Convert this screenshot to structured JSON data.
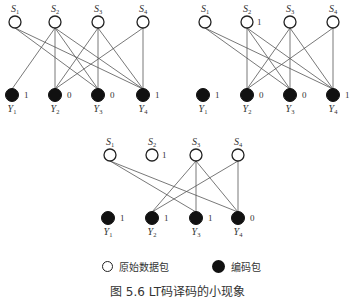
{
  "figure": {
    "caption": "图 5.6  LT码译码的小现象",
    "legend": {
      "source_label": "原始数据包",
      "encoded_label": "编码包"
    }
  },
  "graphs": [
    {
      "name": "stage-1",
      "source_nodes": [
        {
          "label": "S",
          "sub": "1",
          "x": 15,
          "y": 22,
          "value": ""
        },
        {
          "label": "S",
          "sub": "2",
          "x": 55,
          "y": 22,
          "value": ""
        },
        {
          "label": "S",
          "sub": "3",
          "x": 98,
          "y": 22,
          "value": ""
        },
        {
          "label": "S",
          "sub": "4",
          "x": 143,
          "y": 22,
          "value": ""
        }
      ],
      "encoded_nodes": [
        {
          "label": "Y",
          "sub": "1",
          "x": 12,
          "y": 95,
          "value": "1"
        },
        {
          "label": "Y",
          "sub": "2",
          "x": 55,
          "y": 95,
          "value": "0"
        },
        {
          "label": "Y",
          "sub": "3",
          "x": 98,
          "y": 95,
          "value": "0"
        },
        {
          "label": "Y",
          "sub": "4",
          "x": 143,
          "y": 95,
          "value": "1"
        }
      ],
      "edges": [
        [
          0,
          2
        ],
        [
          0,
          3
        ],
        [
          1,
          0
        ],
        [
          1,
          1
        ],
        [
          1,
          2
        ],
        [
          1,
          3
        ],
        [
          2,
          1
        ],
        [
          2,
          2
        ],
        [
          2,
          3
        ],
        [
          3,
          1
        ],
        [
          3,
          3
        ]
      ]
    },
    {
      "name": "stage-2",
      "source_nodes": [
        {
          "label": "S",
          "sub": "1",
          "x": 205,
          "y": 22,
          "value": ""
        },
        {
          "label": "S",
          "sub": "2",
          "x": 247,
          "y": 22,
          "value": "1"
        },
        {
          "label": "S",
          "sub": "3",
          "x": 290,
          "y": 22,
          "value": ""
        },
        {
          "label": "S",
          "sub": "4",
          "x": 333,
          "y": 22,
          "value": ""
        }
      ],
      "encoded_nodes": [
        {
          "label": "Y",
          "sub": "1",
          "x": 203,
          "y": 95,
          "value": "1"
        },
        {
          "label": "Y",
          "sub": "2",
          "x": 247,
          "y": 95,
          "value": "0"
        },
        {
          "label": "Y",
          "sub": "3",
          "x": 290,
          "y": 95,
          "value": "0"
        },
        {
          "label": "Y",
          "sub": "4",
          "x": 333,
          "y": 95,
          "value": "1"
        }
      ],
      "edges": [
        [
          0,
          2
        ],
        [
          0,
          3
        ],
        [
          1,
          1
        ],
        [
          1,
          2
        ],
        [
          1,
          3
        ],
        [
          2,
          1
        ],
        [
          2,
          2
        ],
        [
          2,
          3
        ],
        [
          3,
          1
        ],
        [
          3,
          3
        ]
      ]
    },
    {
      "name": "stage-3",
      "source_nodes": [
        {
          "label": "S",
          "sub": "1",
          "x": 110,
          "y": 155,
          "value": ""
        },
        {
          "label": "S",
          "sub": "2",
          "x": 152,
          "y": 155,
          "value": "1"
        },
        {
          "label": "S",
          "sub": "3",
          "x": 196,
          "y": 155,
          "value": ""
        },
        {
          "label": "S",
          "sub": "4",
          "x": 238,
          "y": 155,
          "value": ""
        }
      ],
      "encoded_nodes": [
        {
          "label": "Y",
          "sub": "1",
          "x": 108,
          "y": 218,
          "value": "1"
        },
        {
          "label": "Y",
          "sub": "2",
          "x": 152,
          "y": 218,
          "value": "1"
        },
        {
          "label": "Y",
          "sub": "3",
          "x": 196,
          "y": 218,
          "value": "1"
        },
        {
          "label": "Y",
          "sub": "4",
          "x": 238,
          "y": 218,
          "value": "0"
        }
      ],
      "edges": [
        [
          0,
          2
        ],
        [
          0,
          3
        ],
        [
          2,
          1
        ],
        [
          2,
          2
        ],
        [
          2,
          3
        ],
        [
          3,
          1
        ],
        [
          3,
          3
        ]
      ]
    }
  ]
}
